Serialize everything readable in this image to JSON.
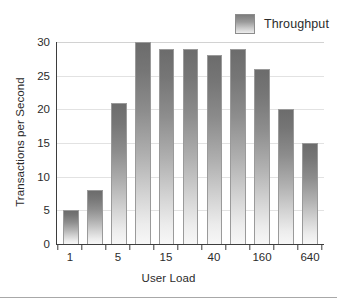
{
  "chart_data": {
    "type": "bar",
    "title": "",
    "xlabel": "User Load",
    "ylabel": "Transactions per Second",
    "categories": [
      "1",
      "2",
      "5",
      "10",
      "15",
      "25",
      "40",
      "80",
      "160",
      "320",
      "640"
    ],
    "visible_xtick_labels": [
      "1",
      "5",
      "15",
      "40",
      "160",
      "640"
    ],
    "values": [
      5,
      8,
      21,
      30,
      29,
      29,
      28,
      29,
      26,
      20,
      15
    ],
    "series": [
      {
        "name": "Throughput",
        "values": [
          5,
          8,
          21,
          30,
          29,
          29,
          28,
          29,
          26,
          20,
          15
        ]
      }
    ],
    "ylim": [
      0,
      30
    ],
    "ytick_values": [
      0,
      5,
      10,
      15,
      20,
      25,
      30
    ],
    "ytick_labels": [
      "0",
      "5",
      "10",
      "15",
      "20",
      "25",
      "30"
    ],
    "grid": true,
    "grid_axis": "y",
    "legend_position": "top-right",
    "bar_color_top": "#6c6c6c",
    "bar_color_bottom": "#f7f7f7",
    "bar_border_color": "#9a9a9a",
    "gridline_color": "#e2e2e2",
    "axis_color": "#3d3d3d"
  },
  "legend": {
    "entries": [
      {
        "label": "Throughput",
        "swatch_icon": "gradient-square-swatch"
      }
    ]
  },
  "axes": {
    "y_title": "Transactions per Second",
    "x_title": "User Load"
  }
}
